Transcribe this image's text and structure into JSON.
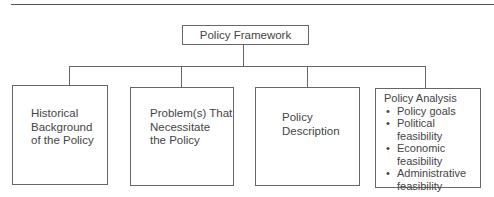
{
  "diagram": {
    "root": {
      "label": "Policy Framework"
    },
    "children": [
      {
        "label": "Historical Background of the Policy",
        "lines": [
          "Historical",
          "Background",
          "of the Policy"
        ]
      },
      {
        "label": "Problem(s) That Necessitate the Policy",
        "lines": [
          "Problem(s) That",
          "Necessitate",
          "the Policy"
        ]
      },
      {
        "label": "Policy Description",
        "lines": [
          "Policy",
          "Description"
        ]
      },
      {
        "label": "Policy Analysis",
        "heading": "Policy Analysis",
        "bullets": [
          "Policy goals",
          "Political feasibility",
          "Economic feasibility",
          "Administrative feasibility"
        ],
        "bullet_lines": [
          [
            "Policy goals"
          ],
          [
            "Political feasibility"
          ],
          [
            "Economic",
            "feasibility"
          ],
          [
            "Administrative",
            "feasibility"
          ]
        ]
      }
    ]
  }
}
